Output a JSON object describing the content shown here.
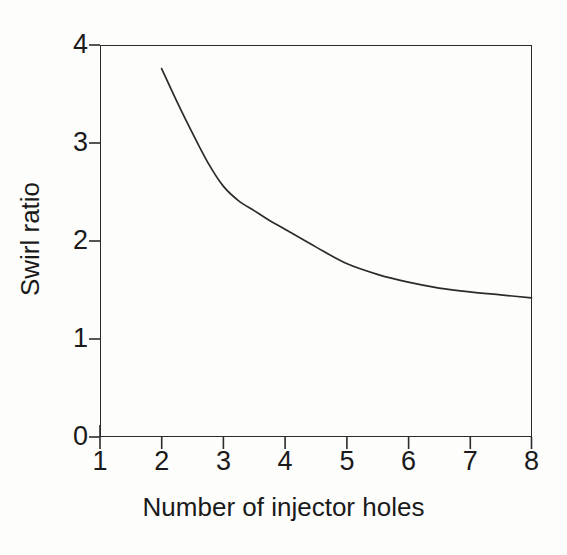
{
  "chart_data": {
    "type": "line",
    "title": "",
    "subtitle": "",
    "xlabel": "Number of injector holes",
    "ylabel": "Swirl ratio",
    "xlim": [
      1,
      8
    ],
    "ylim": [
      0,
      4
    ],
    "xticks": [
      "1",
      "2",
      "3",
      "4",
      "5",
      "6",
      "7",
      "8"
    ],
    "yticks": [
      "0",
      "1",
      "2",
      "3",
      "4"
    ],
    "grid": false,
    "legend": null,
    "series": [
      {
        "name": "Swirl ratio vs number of injector holes",
        "color": "#2b2b2b",
        "x": [
          2.0,
          2.25,
          2.5,
          2.75,
          3.0,
          3.25,
          3.5,
          3.75,
          4.0,
          4.5,
          5.0,
          5.5,
          6.0,
          6.5,
          7.0,
          7.5,
          8.0
        ],
        "y": [
          3.76,
          3.42,
          3.1,
          2.8,
          2.56,
          2.41,
          2.31,
          2.21,
          2.12,
          1.94,
          1.77,
          1.66,
          1.58,
          1.52,
          1.48,
          1.45,
          1.42
        ]
      }
    ],
    "annotations": []
  },
  "axis": {
    "x_title": "Number of injector holes",
    "y_title": "Swirl ratio",
    "x_tick_labels": [
      "1",
      "2",
      "3",
      "4",
      "5",
      "6",
      "7",
      "8"
    ],
    "y_tick_labels": [
      "0",
      "1",
      "2",
      "3",
      "4"
    ]
  },
  "colors": {
    "curve": "#2b2b2b",
    "axis": "#2b2b2b",
    "text": "#1a1a1a",
    "background": "#fdfdfc"
  }
}
